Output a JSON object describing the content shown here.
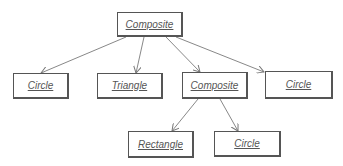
{
  "diagram": {
    "type": "object-tree",
    "nodes": [
      {
        "id": "n0",
        "label": "Composite",
        "x": 117,
        "y": 12,
        "w": 66,
        "h": 25
      },
      {
        "id": "n1",
        "label": "Circle",
        "x": 13,
        "y": 73,
        "w": 56,
        "h": 26
      },
      {
        "id": "n2",
        "label": "Triangle",
        "x": 97,
        "y": 73,
        "w": 66,
        "h": 26
      },
      {
        "id": "n3",
        "label": "Composite",
        "x": 182,
        "y": 72,
        "w": 66,
        "h": 27
      },
      {
        "id": "n4",
        "label": "Circle",
        "x": 265,
        "y": 71,
        "w": 68,
        "h": 28
      },
      {
        "id": "n5",
        "label": "Rectangle",
        "x": 128,
        "y": 131,
        "w": 66,
        "h": 27
      },
      {
        "id": "n6",
        "label": "Circle",
        "x": 214,
        "y": 131,
        "w": 67,
        "h": 26
      }
    ],
    "edges": [
      {
        "from": "n0",
        "to": "n1"
      },
      {
        "from": "n0",
        "to": "n2"
      },
      {
        "from": "n0",
        "to": "n3"
      },
      {
        "from": "n0",
        "to": "n4"
      },
      {
        "from": "n3",
        "to": "n5"
      },
      {
        "from": "n3",
        "to": "n6"
      }
    ],
    "colors": {
      "line": "#777777",
      "border": "#555555",
      "text": "#555555"
    }
  }
}
